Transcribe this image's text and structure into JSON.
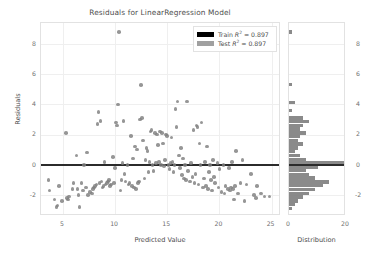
{
  "chart_data": {
    "type": "scatter",
    "title": "Residuals for LinearRegression Model",
    "xlabel": "Predicted Value",
    "ylabel": "Residuals",
    "xlim": [
      2.9,
      25.9
    ],
    "ylim": [
      -3.4,
      9.4
    ],
    "xticks": [
      "5",
      "10",
      "15",
      "20",
      "25"
    ],
    "xtick_values": [
      5,
      10,
      15,
      20,
      25
    ],
    "yticks": [
      "8",
      "6",
      "4",
      "2",
      "0",
      "-2"
    ],
    "ytick_values": [
      8,
      6,
      4,
      2,
      0,
      -2
    ],
    "grid": true,
    "legend_position": "upper right",
    "zero_line": 0,
    "point_color": "#7f7f7f",
    "train_color": "#000000",
    "test_color": "#a0a0a0",
    "series": [
      {
        "name": "Test",
        "points": [
          [
            3.6,
            -1.0
          ],
          [
            3.7,
            -1.7
          ],
          [
            4.2,
            -2.3
          ],
          [
            4.4,
            -2.8
          ],
          [
            4.5,
            -2.7
          ],
          [
            4.6,
            -1.4
          ],
          [
            4.9,
            -2.4
          ],
          [
            5.3,
            2.1
          ],
          [
            5.4,
            -2.2
          ],
          [
            5.5,
            -2.3
          ],
          [
            5.6,
            -2.1
          ],
          [
            5.9,
            -1.6
          ],
          [
            6.0,
            -1.2
          ],
          [
            6.3,
            0.6
          ],
          [
            6.4,
            -1.6
          ],
          [
            6.5,
            -2.0
          ],
          [
            6.6,
            -2.8
          ],
          [
            6.8,
            -1.2
          ],
          [
            6.9,
            -1.7
          ],
          [
            7.0,
            0.0
          ],
          [
            7.2,
            -1.5
          ],
          [
            7.3,
            0.8
          ],
          [
            7.4,
            -2.0
          ],
          [
            7.6,
            -1.8
          ],
          [
            7.8,
            -1.9
          ],
          [
            7.9,
            -1.6
          ],
          [
            8.0,
            -1.5
          ],
          [
            8.1,
            -1.4
          ],
          [
            8.2,
            -1.3
          ],
          [
            8.3,
            2.7
          ],
          [
            8.4,
            3.5
          ],
          [
            8.5,
            -1.2
          ],
          [
            8.6,
            2.9
          ],
          [
            8.7,
            -1.1
          ],
          [
            8.8,
            -1.5
          ],
          [
            8.9,
            -1.4
          ],
          [
            9.0,
            0.2
          ],
          [
            9.1,
            -1.3
          ],
          [
            9.2,
            -1.2
          ],
          [
            9.3,
            -1.1
          ],
          [
            9.4,
            -1.0
          ],
          [
            9.5,
            -1.4
          ],
          [
            9.6,
            -1.3
          ],
          [
            9.8,
            0.5
          ],
          [
            9.9,
            -1.2
          ],
          [
            10.0,
            -0.2
          ],
          [
            10.1,
            2.8
          ],
          [
            10.2,
            2.6
          ],
          [
            10.3,
            4.0
          ],
          [
            10.4,
            8.8
          ],
          [
            10.5,
            -1.7
          ],
          [
            10.6,
            -1.0
          ],
          [
            10.7,
            0.1
          ],
          [
            10.8,
            2.9
          ],
          [
            10.9,
            -0.6
          ],
          [
            11.0,
            -1.1
          ],
          [
            11.2,
            0.0
          ],
          [
            11.3,
            -1.3
          ],
          [
            11.4,
            -1.2
          ],
          [
            11.5,
            1.9
          ],
          [
            11.6,
            -1.4
          ],
          [
            11.7,
            0.4
          ],
          [
            11.8,
            -1.5
          ],
          [
            11.9,
            1.2
          ],
          [
            12.0,
            -1.6
          ],
          [
            12.1,
            1.0
          ],
          [
            12.2,
            -1.2
          ],
          [
            12.3,
            -1.1
          ],
          [
            12.4,
            3.0
          ],
          [
            12.5,
            5.3
          ],
          [
            12.6,
            3.1
          ],
          [
            12.7,
            1.6
          ],
          [
            12.8,
            -0.9
          ],
          [
            12.9,
            0.3
          ],
          [
            13.0,
            1.1
          ],
          [
            13.1,
            0.9
          ],
          [
            13.2,
            -0.5
          ],
          [
            13.3,
            0.2
          ],
          [
            13.4,
            2.2
          ],
          [
            13.5,
            2.3
          ],
          [
            13.6,
            0.0
          ],
          [
            13.7,
            -0.4
          ],
          [
            13.8,
            2.1
          ],
          [
            13.9,
            0.1
          ],
          [
            14.0,
            2.0
          ],
          [
            14.1,
            1.3
          ],
          [
            14.2,
            0.2
          ],
          [
            14.3,
            2.2
          ],
          [
            14.4,
            0.0
          ],
          [
            14.5,
            2.1
          ],
          [
            14.6,
            1.4
          ],
          [
            14.7,
            -0.1
          ],
          [
            14.8,
            0.3
          ],
          [
            14.9,
            2.0
          ],
          [
            15.0,
            1.9
          ],
          [
            15.1,
            0.0
          ],
          [
            15.2,
            -0.3
          ],
          [
            15.3,
            0.1
          ],
          [
            15.4,
            1.8
          ],
          [
            15.5,
            0.2
          ],
          [
            15.6,
            -0.5
          ],
          [
            15.7,
            0.0
          ],
          [
            15.8,
            3.7
          ],
          [
            15.9,
            2.5
          ],
          [
            16.0,
            4.2
          ],
          [
            16.1,
            0.6
          ],
          [
            16.2,
            -0.2
          ],
          [
            16.3,
            1.1
          ],
          [
            16.4,
            -0.7
          ],
          [
            16.5,
            0.4
          ],
          [
            16.6,
            -0.9
          ],
          [
            16.7,
            0.0
          ],
          [
            16.8,
            -1.0
          ],
          [
            16.9,
            4.2
          ],
          [
            17.0,
            -0.4
          ],
          [
            17.2,
            -1.1
          ],
          [
            17.3,
            0.1
          ],
          [
            17.4,
            -0.8
          ],
          [
            17.5,
            2.3
          ],
          [
            17.6,
            -1.2
          ],
          [
            17.7,
            -0.6
          ],
          [
            17.8,
            2.6
          ],
          [
            17.9,
            2.5
          ],
          [
            18.0,
            -1.3
          ],
          [
            18.1,
            1.4
          ],
          [
            18.2,
            0.0
          ],
          [
            18.3,
            2.8
          ],
          [
            18.4,
            -1.5
          ],
          [
            18.5,
            -0.9
          ],
          [
            18.6,
            0.2
          ],
          [
            18.7,
            -1.4
          ],
          [
            18.8,
            1.2
          ],
          [
            18.9,
            -1.6
          ],
          [
            19.0,
            -0.5
          ],
          [
            19.1,
            0.0
          ],
          [
            19.2,
            -1.0
          ],
          [
            19.3,
            -1.7
          ],
          [
            19.4,
            0.3
          ],
          [
            19.5,
            -0.8
          ],
          [
            19.6,
            -1.2
          ],
          [
            19.8,
            0.1
          ],
          [
            19.9,
            -1.5
          ],
          [
            20.0,
            -0.3
          ],
          [
            20.2,
            -1.8
          ],
          [
            20.4,
            0.0
          ],
          [
            20.5,
            -1.9
          ],
          [
            20.6,
            -1.4
          ],
          [
            20.8,
            -1.6
          ],
          [
            20.9,
            -0.2
          ],
          [
            21.0,
            -1.7
          ],
          [
            21.1,
            -1.5
          ],
          [
            21.2,
            0.2
          ],
          [
            21.3,
            -1.6
          ],
          [
            21.4,
            -2.3
          ],
          [
            21.5,
            -1.4
          ],
          [
            21.6,
            0.9
          ],
          [
            21.8,
            -1.9
          ],
          [
            22.0,
            -1.2
          ],
          [
            22.2,
            0.3
          ],
          [
            22.4,
            -2.4
          ],
          [
            22.6,
            -1.3
          ],
          [
            23.0,
            -0.6
          ],
          [
            23.3,
            -2.0
          ],
          [
            23.5,
            -2.2
          ],
          [
            23.6,
            -1.4
          ],
          [
            24.0,
            -1.9
          ],
          [
            24.3,
            -2.1
          ],
          [
            24.8,
            -2.1
          ]
        ]
      }
    ],
    "legend": [
      {
        "label_prefix": "Train",
        "symbol": "R",
        "exponent": "2",
        "value": "= 0.897",
        "color": "#000000"
      },
      {
        "label_prefix": "Test",
        "symbol": "R",
        "exponent": "2",
        "value": "= 0.897",
        "color": "#a0a0a0"
      }
    ],
    "histogram": {
      "orientation": "horizontal",
      "xlabel": "Distribution",
      "xlim": [
        0,
        20
      ],
      "xticks": [
        "0",
        "20"
      ],
      "xtick_values": [
        0,
        20
      ],
      "yticks": [
        "8",
        "6",
        "4",
        "2",
        "0",
        "-2"
      ],
      "ytick_values": [
        8,
        6,
        4,
        2,
        0,
        -2
      ],
      "bin_centers": [
        8.8,
        5.3,
        4.1,
        3.6,
        3.1,
        2.85,
        2.6,
        2.35,
        2.1,
        1.85,
        1.6,
        1.35,
        1.1,
        0.85,
        0.6,
        0.35,
        0.1,
        -0.15,
        -0.4,
        -0.65,
        -0.9,
        -1.15,
        -1.4,
        -1.65,
        -1.9,
        -2.15,
        -2.4,
        -2.65,
        -2.9
      ],
      "counts": [
        1,
        1,
        2,
        1,
        5,
        7,
        5,
        4,
        6,
        4,
        3,
        5,
        3,
        2,
        4,
        6,
        20,
        10,
        6,
        7,
        9,
        14,
        12,
        9,
        7,
        5,
        3,
        2,
        1
      ],
      "bar_color": "#808080"
    }
  }
}
